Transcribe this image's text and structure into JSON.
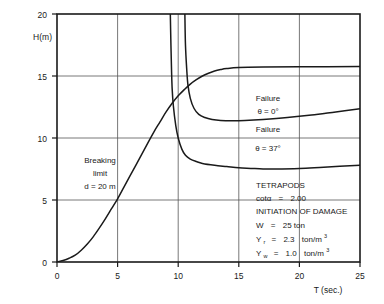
{
  "chart_data": {
    "type": "line",
    "title": "",
    "xlabel": "T (sec.)",
    "ylabel": "H(m)",
    "xlim": [
      0,
      25
    ],
    "ylim": [
      0,
      20
    ],
    "xticks": [
      0,
      5,
      10,
      15,
      20,
      25
    ],
    "yticks": [
      0,
      5,
      10,
      15,
      20
    ],
    "xtick_labels": [
      "0",
      "5",
      "10",
      "15",
      "20",
      "25"
    ],
    "ytick_labels": [
      "0",
      "5",
      "10",
      "15",
      "20"
    ],
    "grid": true,
    "legend_position": "none",
    "series": [
      {
        "name": "Breaking limit d = 20 m",
        "points": [
          [
            0.0,
            0.0
          ],
          [
            0.5,
            0.12
          ],
          [
            1.0,
            0.3
          ],
          [
            1.5,
            0.55
          ],
          [
            2.0,
            0.95
          ],
          [
            2.5,
            1.45
          ],
          [
            3.0,
            2.05
          ],
          [
            3.5,
            2.75
          ],
          [
            4.0,
            3.5
          ],
          [
            4.5,
            4.3
          ],
          [
            5.0,
            5.1
          ],
          [
            5.5,
            6.0
          ],
          [
            6.0,
            6.9
          ],
          [
            6.5,
            7.8
          ],
          [
            7.0,
            8.7
          ],
          [
            7.5,
            9.6
          ],
          [
            8.0,
            10.5
          ],
          [
            8.5,
            11.3
          ],
          [
            9.0,
            12.1
          ],
          [
            9.5,
            12.8
          ],
          [
            10.0,
            13.4
          ],
          [
            10.5,
            13.9
          ],
          [
            11.0,
            14.35
          ],
          [
            11.5,
            14.7
          ],
          [
            12.0,
            15.0
          ],
          [
            12.5,
            15.22
          ],
          [
            13.0,
            15.4
          ],
          [
            13.5,
            15.52
          ],
          [
            14.0,
            15.6
          ],
          [
            15.0,
            15.68
          ],
          [
            17.0,
            15.72
          ],
          [
            20.0,
            15.74
          ],
          [
            25.0,
            15.76
          ]
        ]
      },
      {
        "name": "Failure theta = 0 deg",
        "points": [
          [
            9.35,
            20.0
          ],
          [
            9.4,
            17.5
          ],
          [
            9.45,
            15.5
          ],
          [
            9.5,
            14.0
          ],
          [
            9.6,
            12.6
          ],
          [
            9.8,
            11.0
          ],
          [
            10.0,
            10.0
          ],
          [
            10.3,
            9.1
          ],
          [
            10.6,
            8.6
          ],
          [
            11.0,
            8.3
          ],
          [
            11.5,
            8.1
          ],
          [
            12.0,
            7.95
          ],
          [
            13.0,
            7.8
          ],
          [
            14.0,
            7.7
          ],
          [
            15.0,
            7.6
          ],
          [
            16.0,
            7.55
          ],
          [
            17.0,
            7.5
          ],
          [
            18.0,
            7.5
          ],
          [
            20.0,
            7.55
          ],
          [
            22.0,
            7.65
          ],
          [
            25.0,
            7.8
          ]
        ]
      },
      {
        "name": "Failure theta = 37 deg",
        "points": [
          [
            10.55,
            20.0
          ],
          [
            10.6,
            17.5
          ],
          [
            10.7,
            15.6
          ],
          [
            10.8,
            14.3
          ],
          [
            11.0,
            13.2
          ],
          [
            11.3,
            12.4
          ],
          [
            11.7,
            11.9
          ],
          [
            12.2,
            11.65
          ],
          [
            12.8,
            11.5
          ],
          [
            13.5,
            11.42
          ],
          [
            14.5,
            11.4
          ],
          [
            15.5,
            11.42
          ],
          [
            17.0,
            11.5
          ],
          [
            19.0,
            11.65
          ],
          [
            21.0,
            11.85
          ],
          [
            23.0,
            12.1
          ],
          [
            25.0,
            12.35
          ]
        ]
      }
    ],
    "annotations": [
      {
        "name": "breaking-limit-annotation",
        "lines": [
          "Breaking",
          "limit",
          "d = 20 m"
        ],
        "x": 3.6,
        "y": 7.5
      },
      {
        "name": "failure-theta0-annotation",
        "lines": [
          "Failure",
          "θ = 0°"
        ],
        "x": 17.0,
        "y": 13.2
      },
      {
        "name": "failure-theta37-annotation",
        "lines": [
          "Failure",
          "θ = 37°"
        ],
        "x": 17.0,
        "y": 10.4
      }
    ],
    "parameter_box": {
      "name": "parameters-legend",
      "lines": [
        "TETRAPODS",
        "cotα  =  2.00",
        "INITIATION OF DAMAGE",
        "W  =  25 ton",
        "Yᵣ  =  2.3  ton/m³",
        "Yᵥᵥ  =  1.0  ton/m³"
      ]
    }
  },
  "axes": {
    "y_label": "H(m)",
    "x_label": "T (sec.)",
    "x_ticks": [
      "0",
      "5",
      "10",
      "15",
      "20",
      "25"
    ],
    "y_ticks": [
      "20",
      "15",
      "10",
      "5",
      "0"
    ]
  },
  "annotations": {
    "breaking": {
      "line1": "Breaking",
      "line2": "limit",
      "line3": "d = 20 m"
    },
    "failure0": {
      "line1": "Failure",
      "line2": "θ = 0°"
    },
    "failure37": {
      "line1": "Failure",
      "line2": "θ = 37°"
    }
  },
  "legend_block": {
    "material": "TETRAPODS",
    "slope_label": "cotα",
    "slope_eq": "=",
    "slope_value": "2.00",
    "criterion": "INITIATION OF DAMAGE",
    "weight_label": "W",
    "weight_eq": "=",
    "weight_value": "25 ton",
    "gamma_r_label": "Y",
    "gamma_r_sub": "r",
    "gamma_r_eq": "=",
    "gamma_r_value": "2.3",
    "gamma_r_unit": "ton/m",
    "gamma_r_exp": "3",
    "gamma_w_label": "Y",
    "gamma_w_sub": "w",
    "gamma_w_eq": "=",
    "gamma_w_value": "1.0",
    "gamma_w_unit": "ton/m",
    "gamma_w_exp": "3"
  },
  "colors": {
    "line": "#1a1a1a",
    "grid": "#555555",
    "frame": "#1a1a1a",
    "background": "#ffffff"
  }
}
